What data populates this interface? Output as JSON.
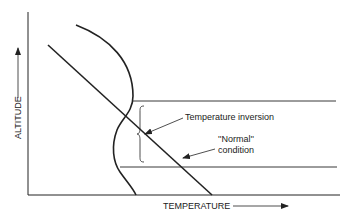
{
  "diagram": {
    "axes": {
      "y_label": "ALTITUDE",
      "x_label": "TEMPERATURE"
    },
    "annotations": {
      "inversion_label": "Temperature inversion",
      "normal_label_line1": "''Normal''",
      "normal_label_line2": "condition"
    },
    "curves": [
      {
        "name": "normal-lapse-line",
        "description": "Straight line: temperature decreases with altitude"
      },
      {
        "name": "inversion-curve",
        "description": "Curved profile with temperature increasing with altitude in the inversion layer"
      }
    ],
    "layers": [
      {
        "name": "inversion-layer-top",
        "description": "Upper boundary of inversion layer"
      },
      {
        "name": "inversion-layer-bottom",
        "description": "Lower boundary of inversion layer"
      }
    ],
    "colors": {
      "ink": "#222222",
      "background": "#ffffff"
    }
  }
}
